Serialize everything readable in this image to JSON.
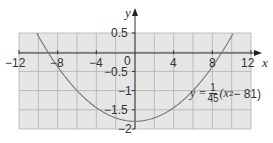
{
  "chart_data": {
    "type": "line",
    "title": "",
    "xlabel": "x",
    "ylabel": "y",
    "xlim": [
      -12,
      12
    ],
    "ylim": [
      -2,
      0.5
    ],
    "grid": true,
    "x_ticks": [
      -12,
      -8,
      -4,
      0,
      4,
      8,
      12
    ],
    "x_tick_labels": [
      "−12",
      "−8",
      "−4",
      "0",
      "4",
      "8",
      "12"
    ],
    "y_ticks": [
      0.5,
      -0.5,
      -1,
      -1.5,
      -2
    ],
    "y_tick_labels": [
      "0.5",
      "−0.5",
      "−1",
      "−1.5",
      "−2"
    ],
    "series": [
      {
        "name": "y = (1/45)(x² − 81)",
        "function": "(x^2 - 81)/45",
        "x": [
          -10.17,
          -10,
          -9,
          -8,
          -6,
          -4,
          -2,
          0,
          2,
          4,
          6,
          8,
          9,
          10,
          10.17
        ],
        "values": [
          0.5,
          0.42,
          0,
          -0.38,
          -1.0,
          -1.44,
          -1.71,
          -1.8,
          -1.71,
          -1.44,
          -1.0,
          -0.38,
          0,
          0.42,
          0.5
        ]
      }
    ],
    "annotations": [
      {
        "text": "y = 1/45 (x² − 81)",
        "position": "lower-right"
      }
    ],
    "colors": {
      "grid_fill": "#e6e6e6",
      "grid_line": "#aaaaaa",
      "axis": "#333333",
      "curve": "#777777"
    }
  },
  "labels": {
    "x_axis": "x",
    "y_axis": "y",
    "x_ticks": [
      "−12",
      "−8",
      "−4",
      "0",
      "4",
      "8",
      "12"
    ],
    "y_ticks": [
      "0.5",
      "−0.5",
      "−1",
      "−1.5",
      "−2"
    ],
    "equation": {
      "lhs": "y =",
      "frac_num": "1",
      "frac_den": "45",
      "rhs_open": "(x",
      "rhs_exp": "2",
      "rhs_close": " − 81)"
    }
  }
}
